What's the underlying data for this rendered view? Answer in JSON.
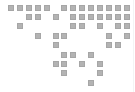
{
  "grid": {
    "cell_color": "#b3b3b3",
    "background": "#ffffff",
    "columns": 14,
    "rows": 9,
    "filled": [
      [
        0,
        0
      ],
      [
        0,
        1
      ],
      [
        0,
        2
      ],
      [
        0,
        3
      ],
      [
        0,
        4
      ],
      [
        0,
        6
      ],
      [
        0,
        7
      ],
      [
        0,
        8
      ],
      [
        0,
        9
      ],
      [
        0,
        10
      ],
      [
        0,
        11
      ],
      [
        0,
        12
      ],
      [
        0,
        13
      ],
      [
        1,
        2
      ],
      [
        1,
        3
      ],
      [
        1,
        5
      ],
      [
        1,
        7
      ],
      [
        1,
        8
      ],
      [
        1,
        9
      ],
      [
        1,
        10
      ],
      [
        1,
        11
      ],
      [
        1,
        12
      ],
      [
        1,
        13
      ],
      [
        2,
        1
      ],
      [
        2,
        7
      ],
      [
        2,
        8
      ],
      [
        2,
        10
      ],
      [
        2,
        12
      ],
      [
        2,
        13
      ],
      [
        3,
        3
      ],
      [
        3,
        5
      ],
      [
        3,
        6
      ],
      [
        3,
        11
      ],
      [
        3,
        13
      ],
      [
        4,
        5
      ],
      [
        4,
        11
      ],
      [
        4,
        12
      ],
      [
        5,
        6
      ],
      [
        5,
        7
      ],
      [
        5,
        9
      ],
      [
        6,
        5
      ],
      [
        6,
        6
      ],
      [
        6,
        8
      ],
      [
        6,
        10
      ],
      [
        7,
        6
      ],
      [
        7,
        10
      ],
      [
        8,
        9
      ]
    ]
  }
}
